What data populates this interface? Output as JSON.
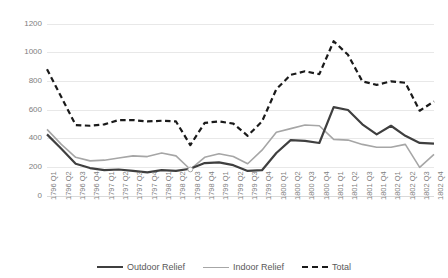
{
  "chart_data": {
    "type": "line",
    "title": "",
    "xlabel": "",
    "ylabel": "",
    "ylim": [
      0,
      1200
    ],
    "y_ticks": [
      0,
      200,
      400,
      600,
      800,
      1000,
      1200
    ],
    "grid": "horizontal",
    "legend_position": "bottom",
    "categories": [
      "1796 Q1",
      "1796 Q2",
      "1796 Q3",
      "1796 Q4",
      "1797 Q1",
      "1797 Q2",
      "1797 Q3",
      "1797 Q4",
      "1798 Q1",
      "1798 Q2",
      "1798 Q3",
      "1798 Q4",
      "1799 Q1",
      "1799 Q2",
      "1799 Q3",
      "1799 Q4",
      "1800 Q1",
      "1800 Q2",
      "1800 Q3",
      "1800 Q4",
      "1801 Q1",
      "1801 Q2",
      "1801 Q3",
      "1801 Q4",
      "1802 Q1",
      "1802 Q2",
      "1802 Q3",
      "1802 Q4"
    ],
    "series": [
      {
        "name": "Outdoor Relief",
        "color": "#3f3f3f",
        "style": "solid",
        "width": 2.2,
        "values": [
          430,
          330,
          225,
          195,
          180,
          185,
          175,
          165,
          180,
          175,
          190,
          230,
          235,
          215,
          175,
          180,
          300,
          390,
          385,
          370,
          620,
          600,
          500,
          430,
          490,
          420,
          370,
          365
        ]
      },
      {
        "name": "Indoor Relief",
        "color": "#a6a6a6",
        "style": "solid",
        "width": 1.6,
        "values": [
          465,
          360,
          270,
          245,
          250,
          265,
          280,
          275,
          300,
          280,
          185,
          270,
          295,
          275,
          225,
          320,
          445,
          470,
          495,
          490,
          395,
          390,
          360,
          340,
          340,
          360,
          200,
          290
        ]
      },
      {
        "name": "Total",
        "color": "#1a1a1a",
        "style": "dashed",
        "width": 2.2,
        "values": [
          885,
          690,
          495,
          490,
          500,
          530,
          530,
          520,
          525,
          520,
          355,
          510,
          520,
          505,
          420,
          520,
          745,
          845,
          870,
          850,
          1080,
          985,
          800,
          775,
          800,
          790,
          595,
          660
        ]
      }
    ]
  },
  "legend": {
    "items": [
      {
        "label": "Outdoor Relief"
      },
      {
        "label": "Indoor Relief"
      },
      {
        "label": "Total"
      }
    ]
  }
}
